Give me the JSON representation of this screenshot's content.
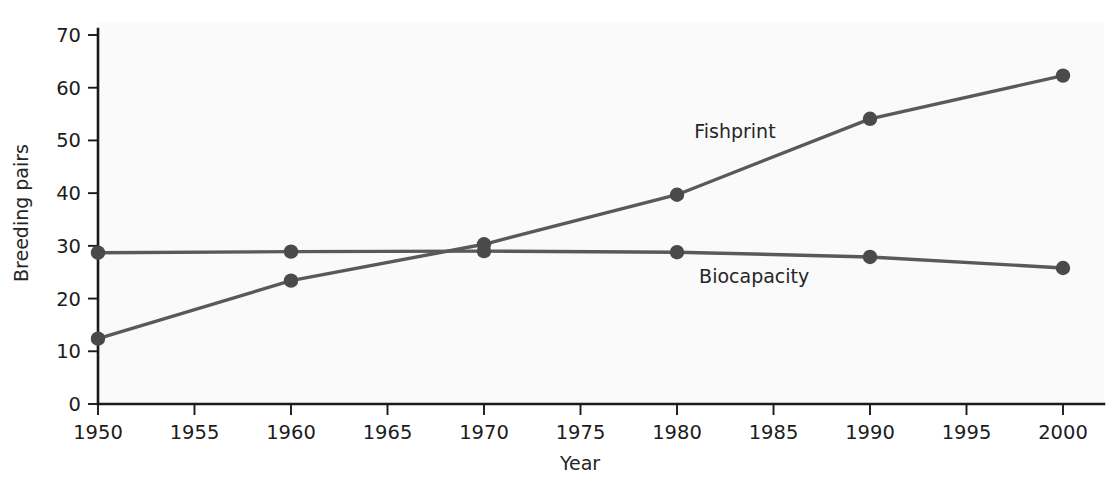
{
  "chart_data": {
    "type": "line",
    "title": "",
    "xlabel": "Year",
    "ylabel": "Breeding pairs",
    "x": [
      1950,
      1960,
      1970,
      1980,
      1990,
      2000
    ],
    "xlim": [
      1950,
      2000
    ],
    "ylim": [
      0,
      70
    ],
    "x_ticks": [
      1950,
      1955,
      1960,
      1965,
      1970,
      1975,
      1980,
      1985,
      1990,
      1995,
      2000
    ],
    "x_tick_labels": [
      "1950",
      "1955",
      "1960",
      "1965",
      "1970",
      "1975",
      "1980",
      "1985",
      "1990",
      "1995",
      "2000"
    ],
    "y_ticks": [
      0,
      10,
      20,
      30,
      40,
      50,
      60,
      70
    ],
    "y_tick_labels": [
      "0",
      "10",
      "20",
      "30",
      "40",
      "50",
      "60",
      "70"
    ],
    "grid": false,
    "legend_position": "inline-annotation",
    "series": [
      {
        "name": "Fishprint",
        "color": "#595959",
        "marker": "circle",
        "values": [
          12.4,
          23.4,
          30.3,
          39.7,
          54.1,
          62.3
        ],
        "label_x": 1983,
        "label_y": 50.5
      },
      {
        "name": "Biocapacity",
        "color": "#595959",
        "marker": "circle",
        "values": [
          28.7,
          28.9,
          29.0,
          28.8,
          27.9,
          25.8
        ],
        "label_x": 1984,
        "label_y": 23.0
      }
    ]
  },
  "annotations": {
    "fishprint_label": "Fishprint",
    "biocapacity_label": "Biocapacity"
  },
  "colors": {
    "series_line": "#595959",
    "marker": "#4a4a4a",
    "axis": "#1a1a1a",
    "plot_background": "#fafafa",
    "page_background": "#ffffff",
    "text": "#1c1c1c"
  }
}
